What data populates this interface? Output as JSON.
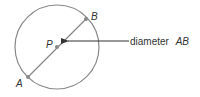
{
  "diagram": {
    "colors": {
      "stroke": "#888888",
      "point": "#888888",
      "arrow": "#333333",
      "text": "#333333",
      "background": "#ffffff"
    },
    "circle": {
      "cx": 57,
      "cy": 47,
      "r": 42
    },
    "points": [
      {
        "id": "A",
        "label": "A",
        "x": 28,
        "y": 77
      },
      {
        "id": "P",
        "label": "P",
        "x": 57,
        "y": 47
      },
      {
        "id": "B",
        "label": "B",
        "x": 86,
        "y": 19
      }
    ],
    "annotation": {
      "text": "diameter",
      "ref": "AB",
      "arrow_from_x": 129,
      "arrow_to_x": 66,
      "y": 41
    }
  }
}
